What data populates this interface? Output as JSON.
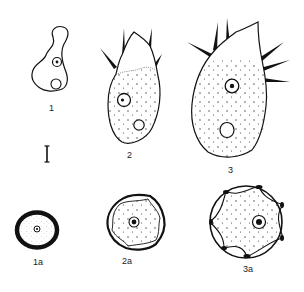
{
  "figure": {
    "type": "scientific-illustration",
    "colors": {
      "ink": "#111111",
      "background": "#ffffff",
      "label": "#222222"
    },
    "panels": [
      {
        "id": "1",
        "label": "1"
      },
      {
        "id": "2",
        "label": "2"
      },
      {
        "id": "3",
        "label": "3"
      },
      {
        "id": "1a",
        "label": "1a"
      },
      {
        "id": "2a",
        "label": "2a"
      },
      {
        "id": "3a",
        "label": "3a"
      }
    ],
    "scale_bar": {
      "present": true,
      "label": ""
    }
  }
}
